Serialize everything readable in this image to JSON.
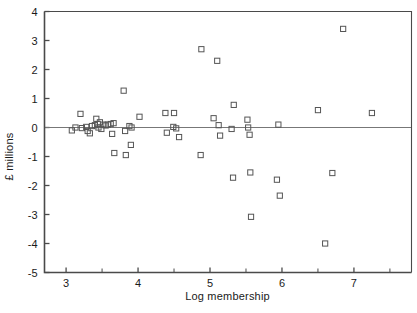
{
  "chart_data": {
    "type": "scatter",
    "title": "",
    "xlabel": "Log membership",
    "ylabel": "£ millions",
    "xlim": [
      2.7,
      7.8
    ],
    "ylim": [
      -5,
      4
    ],
    "xticks": [
      3,
      4,
      5,
      6,
      7
    ],
    "xtick_labels": [
      "3",
      "4",
      "5",
      "6",
      "7"
    ],
    "xminor_ticks": [
      3.5,
      4.5,
      5.5,
      6.5,
      7.5
    ],
    "yticks": [
      -5,
      -4,
      -3,
      -2,
      -1,
      0,
      1,
      2,
      3,
      4
    ],
    "ytick_labels": [
      "-5",
      "-4",
      "-3",
      "-2",
      "-1",
      "0",
      "1",
      "2",
      "3",
      "4"
    ],
    "grid": false,
    "legend": null,
    "zero_line": 0,
    "marker": "open-square",
    "marker_color": "#555555",
    "series": [
      {
        "name": "charities",
        "points": [
          [
            3.08,
            -0.1
          ],
          [
            3.13,
            0.0
          ],
          [
            3.2,
            0.47
          ],
          [
            3.22,
            -0.02
          ],
          [
            3.28,
            0.02
          ],
          [
            3.3,
            -0.12
          ],
          [
            3.33,
            -0.2
          ],
          [
            3.36,
            0.05
          ],
          [
            3.4,
            0.08
          ],
          [
            3.42,
            0.3
          ],
          [
            3.44,
            0.12
          ],
          [
            3.45,
            0.0
          ],
          [
            3.47,
            0.18
          ],
          [
            3.49,
            -0.05
          ],
          [
            3.52,
            0.1
          ],
          [
            3.55,
            0.07
          ],
          [
            3.58,
            0.1
          ],
          [
            3.62,
            0.12
          ],
          [
            3.64,
            -0.22
          ],
          [
            3.66,
            0.15
          ],
          [
            3.67,
            -0.88
          ],
          [
            3.8,
            1.27
          ],
          [
            3.82,
            -0.12
          ],
          [
            3.83,
            -0.95
          ],
          [
            3.88,
            0.05
          ],
          [
            3.9,
            -0.6
          ],
          [
            3.91,
            0.0
          ],
          [
            4.02,
            0.37
          ],
          [
            4.38,
            0.5
          ],
          [
            4.4,
            -0.18
          ],
          [
            4.49,
            0.02
          ],
          [
            4.5,
            0.5
          ],
          [
            4.53,
            -0.03
          ],
          [
            4.57,
            -0.33
          ],
          [
            4.88,
            2.7
          ],
          [
            4.87,
            -0.95
          ],
          [
            5.05,
            0.32
          ],
          [
            5.1,
            2.3
          ],
          [
            5.12,
            0.08
          ],
          [
            5.14,
            -0.28
          ],
          [
            5.3,
            -0.05
          ],
          [
            5.33,
            0.78
          ],
          [
            5.32,
            -1.73
          ],
          [
            5.52,
            0.27
          ],
          [
            5.53,
            0.0
          ],
          [
            5.55,
            -0.25
          ],
          [
            5.56,
            -1.55
          ],
          [
            5.57,
            -3.08
          ],
          [
            5.95,
            0.1
          ],
          [
            5.93,
            -1.8
          ],
          [
            5.97,
            -2.35
          ],
          [
            6.5,
            0.6
          ],
          [
            6.6,
            -4.0
          ],
          [
            6.7,
            -1.57
          ],
          [
            6.85,
            3.4
          ],
          [
            7.25,
            0.5
          ]
        ]
      }
    ]
  },
  "axes": {
    "frame_color": "#4a4a4a",
    "zero_line_color": "#777777"
  }
}
